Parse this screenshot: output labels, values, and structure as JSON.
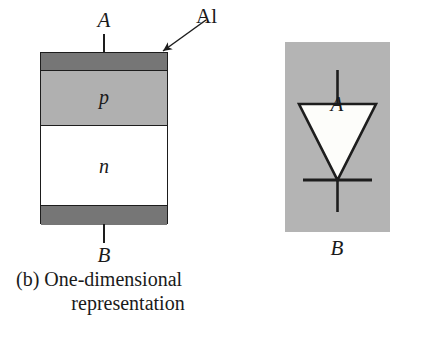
{
  "figure": {
    "type": "textbook-figure",
    "panels": [
      {
        "id": "b",
        "caption_line1": "(b) One-dimensional",
        "caption_line2": "representation",
        "terminals": {
          "top_label": "A",
          "bottom_label": "B"
        },
        "callout": {
          "label": "Al",
          "points_to": "top-right corner of upper aluminium contact"
        },
        "layers": [
          {
            "name": "aluminium-contact-top",
            "label": "",
            "color": "#767676"
          },
          {
            "name": "p-region",
            "label": "p",
            "color": "#b0b0b0"
          },
          {
            "name": "n-region",
            "label": "n",
            "color": "#ffffff"
          },
          {
            "name": "aluminium-contact-bottom",
            "label": "",
            "color": "#767676"
          }
        ]
      },
      {
        "id": "c",
        "caption": "(c) Diode symbol",
        "terminals": {
          "top_label": "A",
          "bottom_label": "B"
        },
        "symbol": {
          "name": "diode",
          "body": "downward-pointing triangle",
          "body_fill": "#fdfdfa",
          "cathode_bar": true,
          "background": "#b4b4b4"
        }
      }
    ]
  },
  "colors": {
    "ink": "#1d1d1d",
    "aluminium": "#767676",
    "p_region": "#b0b0b0",
    "n_region": "#ffffff",
    "panel_background": "#b4b4b4",
    "page_background": "#ffffff"
  }
}
